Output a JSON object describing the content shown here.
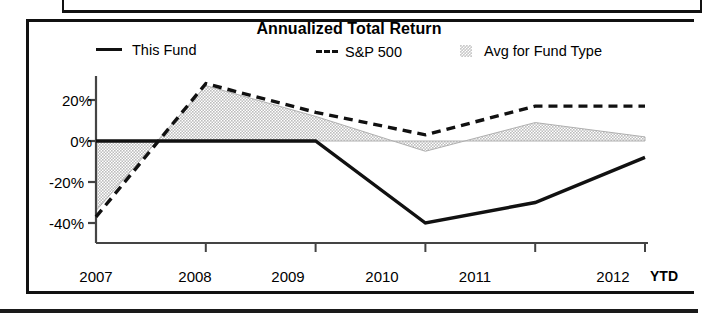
{
  "chart_data": {
    "type": "line",
    "title": "Annualized Total Return",
    "xlabel": "",
    "ylabel": "",
    "x": [
      "2007",
      "2008",
      "2009",
      "2010",
      "2011",
      "2012"
    ],
    "ytd_label": "YTD",
    "ylim": [
      -48,
      32
    ],
    "yticks": [
      20,
      0,
      -20,
      -40
    ],
    "ytick_labels": [
      "20%",
      "0%",
      "-20%",
      "-40%"
    ],
    "grid": false,
    "legend_position": "top",
    "series": [
      {
        "name": "This Fund",
        "style": "solid",
        "color": "#111111",
        "values": [
          0,
          0,
          0,
          -40,
          -30,
          -8
        ]
      },
      {
        "name": "S&P 500",
        "style": "dashed",
        "color": "#111111",
        "values": [
          -37,
          28,
          14,
          3,
          17,
          17
        ]
      },
      {
        "name": "Avg for Fund Type",
        "style": "shaded-band",
        "color": "#c9c9c9",
        "values": [
          -34,
          27,
          12,
          -5,
          9,
          2
        ]
      }
    ],
    "legend": [
      {
        "label": "This Fund",
        "marker": "solid-line"
      },
      {
        "label": "S&P 500",
        "marker": "dashed-line"
      },
      {
        "label": "Avg for Fund Type",
        "marker": "shaded-swatch"
      }
    ],
    "colors": {
      "line": "#111111",
      "band_fill": "#c9c9c9",
      "axis": "#333333",
      "frame": "#111111"
    }
  }
}
